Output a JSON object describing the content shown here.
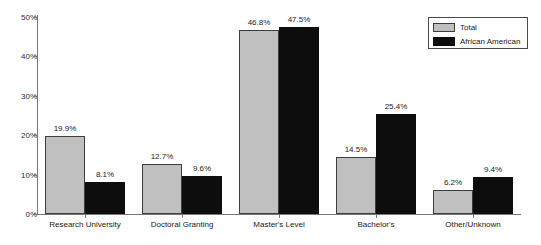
{
  "chart_data": {
    "type": "bar",
    "title": "",
    "subtitle": "",
    "xlabel": "",
    "ylabel": "",
    "ylim": [
      0,
      50
    ],
    "grid": false,
    "legend_position": "top-right",
    "categories": [
      "Research University",
      "Doctoral Granting",
      "Master's Level",
      "Bachelor's",
      "Other/Unknown"
    ],
    "ytick_labels": [
      "0%",
      "10%",
      "20%",
      "30%",
      "40%",
      "50%"
    ],
    "ytick_values": [
      0,
      10,
      20,
      30,
      40,
      50
    ],
    "series": [
      {
        "name": "Total",
        "color": "#c0c0c0",
        "values": [
          19.9,
          12.7,
          46.8,
          14.5,
          6.2
        ],
        "labels": [
          "19.9%",
          "12.7%",
          "46.8%",
          "14.5%",
          "6.2%"
        ]
      },
      {
        "name": "African American",
        "color": "#0d0d0d",
        "values": [
          8.1,
          9.6,
          47.5,
          25.4,
          9.4
        ],
        "labels": [
          "8.1%",
          "9.6%",
          "47.5%",
          "25.4%",
          "9.4%"
        ]
      }
    ]
  },
  "legend": {
    "entries": [
      {
        "label": "Total",
        "swatch": "total"
      },
      {
        "label": "African American",
        "swatch": "aa"
      }
    ]
  }
}
